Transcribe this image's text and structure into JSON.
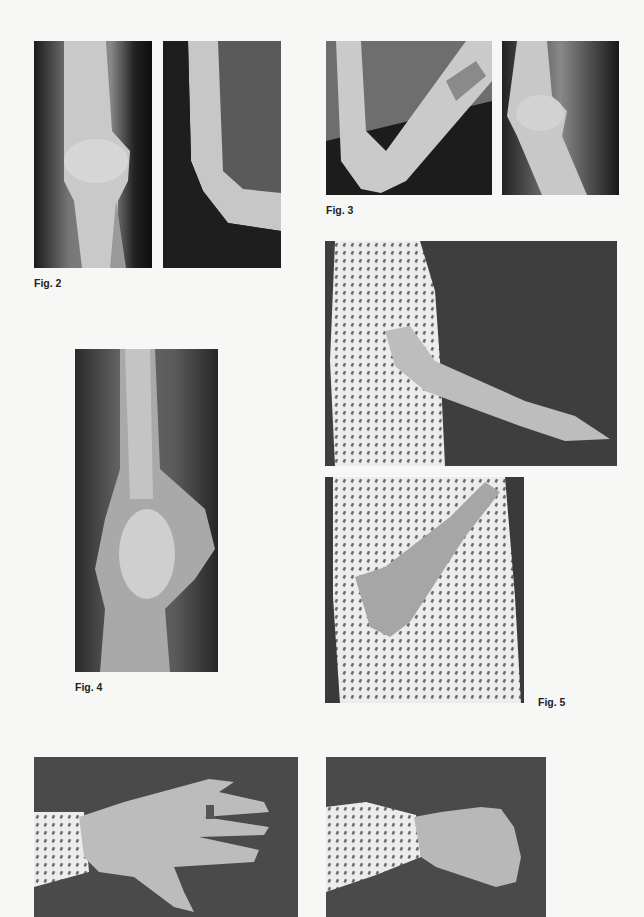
{
  "page": {
    "background": "#f7f7f5",
    "figures": [
      {
        "id": "fig2",
        "caption": "Fig. 2",
        "panels": [
          {
            "name": "xray-elbow-ap",
            "description": "AP radiograph of elbow"
          },
          {
            "name": "xray-elbow-lateral-flexed",
            "description": "Lateral radiograph of flexed elbow"
          }
        ]
      },
      {
        "id": "fig3",
        "caption": "Fig. 3",
        "panels": [
          {
            "name": "xray-elbow-flexed-lateral",
            "description": "Radiograph of elbow in flexion"
          },
          {
            "name": "xray-elbow-lateral-extended",
            "description": "Lateral radiograph of elbow"
          }
        ]
      },
      {
        "id": "fig4",
        "caption": "Fig. 4",
        "panels": [
          {
            "name": "xray-elbow-ap-long",
            "description": "AP radiograph of distal humerus and elbow"
          }
        ]
      },
      {
        "id": "fig5",
        "caption": "Fig. 5",
        "panels": [
          {
            "name": "photo-arm-extended",
            "description": "Patient in patterned dress with arm extended forward"
          },
          {
            "name": "photo-arm-flexed",
            "description": "Patient with elbow flexed, hand on shoulder"
          }
        ]
      },
      {
        "id": "fig6",
        "caption": "",
        "panels": [
          {
            "name": "photo-hand-open",
            "description": "Dorsal view of open hand with ring"
          },
          {
            "name": "photo-hand-fist",
            "description": "Hand clenched in fist"
          }
        ]
      }
    ]
  }
}
